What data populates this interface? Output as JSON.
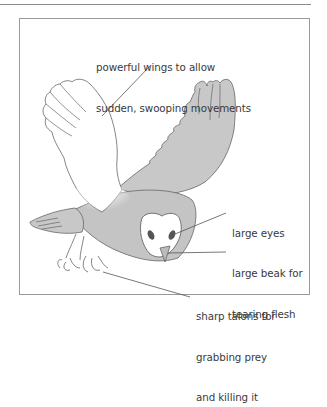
{
  "figure": {
    "fill_colors": {
      "wing_shade": "#c8c8c8",
      "body_shade": "#c2c2c2",
      "outline": "#555555",
      "eye": "#555555",
      "frame": "#9a9a9a"
    },
    "annotations": [
      {
        "id": "wings",
        "line1": "powerful wings to allow",
        "line2": "sudden, swooping movements"
      },
      {
        "id": "eyes",
        "line1": "large eyes"
      },
      {
        "id": "beak",
        "line1": "large beak for",
        "line2": "tearing flesh"
      },
      {
        "id": "talons",
        "line1": "sharp talons for",
        "line2": "grabbing prey",
        "line3": "and killing it"
      }
    ]
  }
}
